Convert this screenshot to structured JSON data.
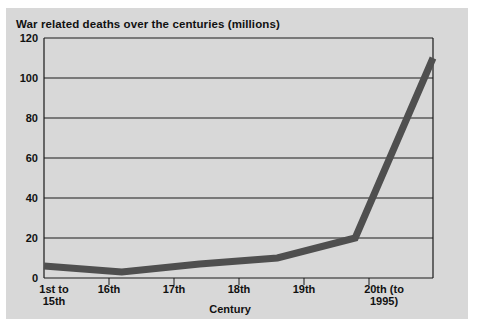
{
  "chart_data": {
    "type": "line",
    "title": "War related deaths over the centuries (millions)",
    "xlabel": "Century",
    "ylabel": "",
    "categories": [
      "1st to\n15th",
      "16th",
      "17th",
      "18th",
      "19th",
      "20th (to\n1995)"
    ],
    "values": [
      6,
      3,
      7,
      10,
      20,
      110
    ],
    "series": [
      {
        "name": "War related deaths",
        "values": [
          6,
          3,
          7,
          10,
          20,
          110
        ]
      }
    ],
    "ylim": [
      0,
      120
    ],
    "yticks": [
      0,
      20,
      40,
      60,
      80,
      100,
      120
    ],
    "ytick_labels": [
      "0",
      "20",
      "40",
      "60",
      "80",
      "100",
      "120"
    ],
    "grid": "horizontal",
    "legend": "none",
    "line_color": "#4f4f4f",
    "plot_background": "#d8d8d8",
    "axis_color": "#1a1a1a"
  },
  "figure": {
    "background": "#ffffff",
    "panel_background": "#d8d8d8"
  }
}
